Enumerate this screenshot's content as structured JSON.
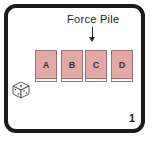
{
  "header": {
    "title": "Force Pile"
  },
  "piles": [
    {
      "label": "A",
      "left": 35
    },
    {
      "label": "B",
      "left": 61
    },
    {
      "label": "C",
      "left": 85
    },
    {
      "label": "D",
      "left": 111
    }
  ],
  "footer": {
    "number": "1"
  },
  "icons": {
    "dice": "dice-icon",
    "arrow": "arrow-down-icon"
  },
  "colors": {
    "pile_fill": "#e3a8a8",
    "border": "#1a1a1a"
  }
}
